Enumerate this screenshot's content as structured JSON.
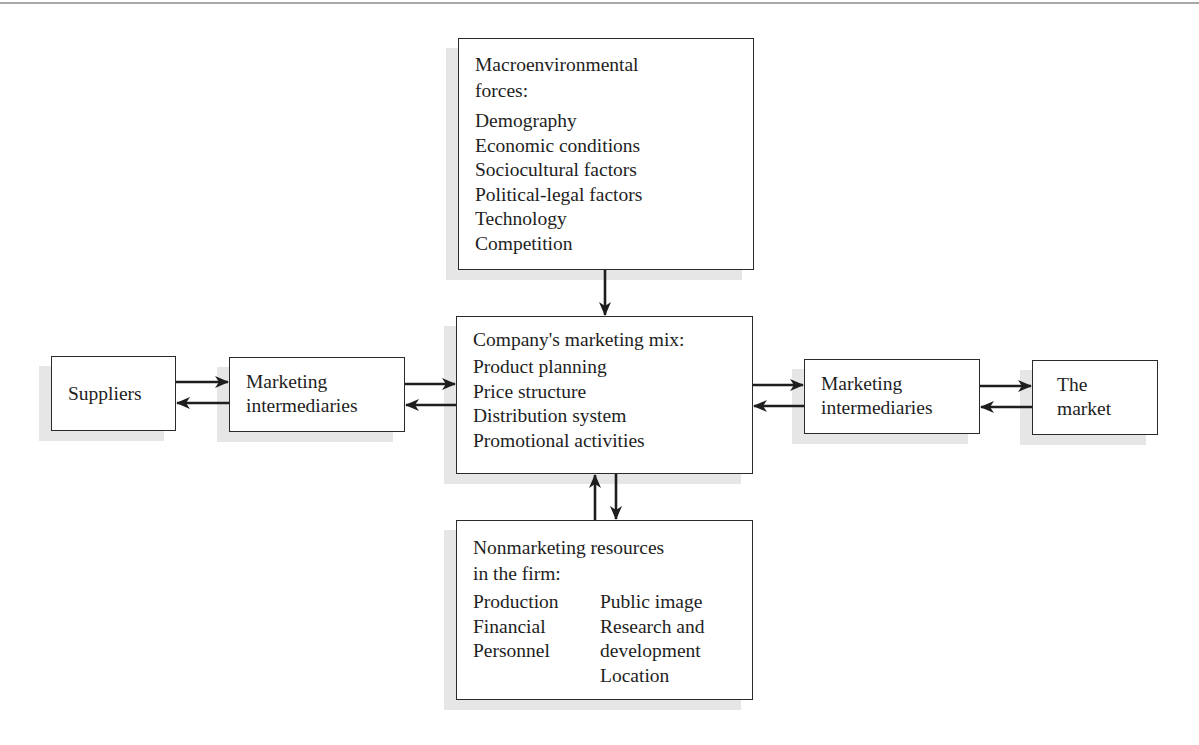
{
  "diagram": {
    "macro": {
      "title_line1": "Macroenvironmental",
      "title_line2": "forces:",
      "items": [
        "Demography",
        "Economic conditions",
        "Sociocultural factors",
        "Political-legal factors",
        "Technology",
        "Competition"
      ]
    },
    "mix": {
      "title": "Company's marketing mix:",
      "items": [
        "Product planning",
        "Price structure",
        "Distribution system",
        "Promotional activities"
      ]
    },
    "suppliers": {
      "label": "Suppliers"
    },
    "left_intermediaries": {
      "line1": "Marketing",
      "line2": "intermediaries"
    },
    "right_intermediaries": {
      "line1": "Marketing",
      "line2": "intermediaries"
    },
    "market": {
      "line1": "The",
      "line2": "market"
    },
    "nonmarketing": {
      "title_line1": "Nonmarketing resources",
      "title_line2": "in the firm:",
      "col1": [
        "Production",
        "Financial",
        "Personnel"
      ],
      "col2": [
        "Public image",
        "Research and",
        "development",
        "Location"
      ]
    }
  }
}
